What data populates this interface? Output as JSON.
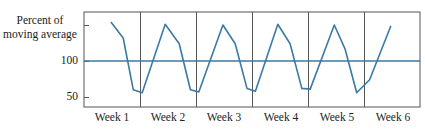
{
  "chart_data": {
    "type": "line",
    "title": "",
    "ylabel": "Percent of moving average",
    "xlabel": "",
    "ylim": [
      35,
      165
    ],
    "yticks": [
      {
        "value": 150,
        "label": ""
      },
      {
        "value": 100,
        "label": "100"
      },
      {
        "value": 50,
        "label": "50"
      }
    ],
    "categories": [
      "Week 1",
      "Week 2",
      "Week 3",
      "Week 4",
      "Week 5",
      "Week 6"
    ],
    "reference_line": {
      "value": 100,
      "label": "100"
    },
    "grid": {
      "vertical_week_dividers": true,
      "horizontal": false
    },
    "legend": null,
    "series": [
      {
        "name": "Percent of moving average",
        "points_per_week": 4,
        "x": [
          0.48,
          0.7,
          0.88,
          1.04,
          1.45,
          1.7,
          1.9,
          2.05,
          2.48,
          2.7,
          2.91,
          3.06,
          3.46,
          3.68,
          3.89,
          4.04,
          4.47,
          4.66,
          4.87,
          5.1,
          5.48
        ],
        "values": [
          154,
          132,
          60,
          56,
          151,
          124,
          60,
          57,
          150,
          124,
          62,
          58,
          151,
          124,
          62,
          61,
          150,
          117,
          56,
          74,
          149
        ]
      }
    ],
    "colors": {
      "line": "#3a7aa3",
      "reference_line": "#3a7aa3",
      "frame": "#555555",
      "divider": "#555555"
    }
  },
  "labels": {
    "ylabel_line1": "Percent of",
    "ylabel_line2": "moving average",
    "ytick_100": "100",
    "ytick_50": "50",
    "weeks": [
      "Week 1",
      "Week 2",
      "Week 3",
      "Week 4",
      "Week 5",
      "Week 6"
    ]
  }
}
